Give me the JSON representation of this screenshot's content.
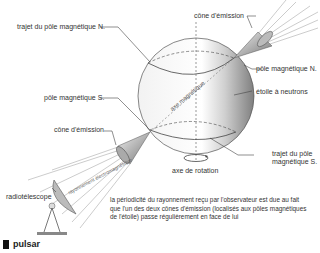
{
  "labels": {
    "north_path": "trajet du pôle magnétique N.",
    "emission_cone_top": "cône d'émission",
    "north_pole": "pôle magnétique N.",
    "south_pole": "pôle magnétique S.",
    "neutron_star": "étoile à neutrons",
    "emission_cone_bottom": "cône d'émission",
    "south_path_line1": "trajet du pôle",
    "south_path_line2": "magnétique S.",
    "magnetic_axis": "axe magnétique",
    "rotation_axis": "axe de rotation",
    "radiotelescope": "radiotélescope",
    "beam": "rayonnement électromagnétique"
  },
  "caption": "la périodicité du rayonnement reçu par l'observateur est due au fait que l'un des deux cônes d'émission (localisés aux pôles magnétiques de l'étoile) passe régulièrement en face de lui",
  "title": "pulsar",
  "colors": {
    "line": "#444444",
    "sphere_light": "#ffffff",
    "sphere_dark": "#8a8a8a",
    "title_mark": "#111111"
  }
}
